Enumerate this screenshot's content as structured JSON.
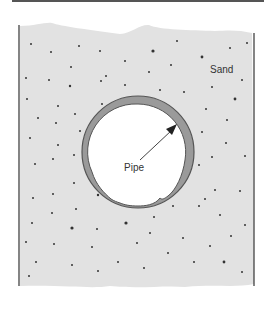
{
  "diagram": {
    "labels": {
      "sand": "Sand",
      "pipe": "Pipe"
    },
    "colors": {
      "sand_fill": "#e2e2e2",
      "pipe_wall": "#9a9a9a",
      "pipe_outline": "#555555",
      "pipe_interior": "#ffffff",
      "grain": "#333333",
      "container_walls": "#333333"
    },
    "pipe": {
      "cx": 138,
      "cy": 152,
      "r_outer": 57,
      "r_inner": 48
    }
  }
}
